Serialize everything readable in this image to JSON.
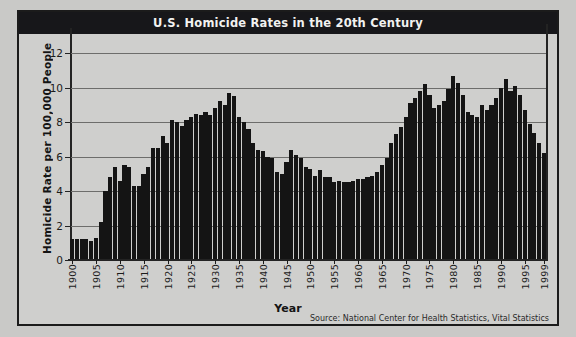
{
  "chart_data": {
    "type": "bar",
    "title": "U.S. Homicide Rates in the 20th Century",
    "xlabel": "Year",
    "ylabel": "Homicide Rate per 100,000 People",
    "source": "Source: National Center for Health Statistics, Vital Statistics",
    "ylim": [
      0,
      13
    ],
    "yticks": [
      0,
      2,
      4,
      6,
      8,
      10,
      12
    ],
    "ytick_labels": [
      "0",
      "2",
      "4",
      "6",
      "8",
      "10",
      "12"
    ],
    "grid": true,
    "grid_axis": "y",
    "legend": "none",
    "bar_color": "#141414",
    "title_bar_color": "#17171a",
    "title_text_color": "#f2f2f0",
    "panel_color": "#cfcfcd",
    "page_color": "#c9c9c7",
    "xtick_labels": [
      "1900",
      "1905",
      "1910",
      "1915",
      "1920",
      "1925",
      "1930",
      "1935",
      "1940",
      "1945",
      "1950",
      "1955",
      "1960",
      "1965",
      "1970",
      "1975",
      "1980",
      "1985",
      "1990",
      "1995",
      "1999"
    ],
    "xtick_years": [
      1900,
      1905,
      1910,
      1915,
      1920,
      1925,
      1930,
      1935,
      1940,
      1945,
      1950,
      1955,
      1960,
      1965,
      1970,
      1975,
      1980,
      1985,
      1990,
      1995,
      1999
    ],
    "x": [
      1900,
      1901,
      1902,
      1903,
      1904,
      1905,
      1906,
      1907,
      1908,
      1909,
      1910,
      1911,
      1912,
      1913,
      1914,
      1915,
      1916,
      1917,
      1918,
      1919,
      1920,
      1921,
      1922,
      1923,
      1924,
      1925,
      1926,
      1927,
      1928,
      1929,
      1930,
      1931,
      1932,
      1933,
      1934,
      1935,
      1936,
      1937,
      1938,
      1939,
      1940,
      1941,
      1942,
      1943,
      1944,
      1945,
      1946,
      1947,
      1948,
      1949,
      1950,
      1951,
      1952,
      1953,
      1954,
      1955,
      1956,
      1957,
      1958,
      1959,
      1960,
      1961,
      1962,
      1963,
      1964,
      1965,
      1966,
      1967,
      1968,
      1969,
      1970,
      1971,
      1972,
      1973,
      1974,
      1975,
      1976,
      1977,
      1978,
      1979,
      1980,
      1981,
      1982,
      1983,
      1984,
      1985,
      1986,
      1987,
      1988,
      1989,
      1990,
      1991,
      1992,
      1993,
      1994,
      1995,
      1996,
      1997,
      1998,
      1999
    ],
    "values": [
      1.2,
      1.2,
      1.2,
      1.2,
      1.1,
      1.3,
      2.2,
      4.0,
      4.8,
      5.4,
      4.6,
      5.5,
      5.4,
      4.3,
      4.3,
      5.0,
      5.4,
      6.5,
      6.5,
      7.2,
      6.8,
      8.1,
      8.0,
      7.8,
      8.1,
      8.3,
      8.5,
      8.4,
      8.6,
      8.4,
      8.8,
      9.2,
      9.0,
      9.7,
      9.5,
      8.3,
      8.0,
      7.6,
      6.8,
      6.4,
      6.3,
      6.0,
      5.9,
      5.1,
      5.0,
      5.7,
      6.4,
      6.1,
      5.9,
      5.4,
      5.3,
      4.9,
      5.2,
      4.8,
      4.8,
      4.5,
      4.6,
      4.5,
      4.5,
      4.6,
      4.7,
      4.7,
      4.8,
      4.9,
      5.1,
      5.5,
      5.9,
      6.8,
      7.3,
      7.7,
      8.3,
      9.1,
      9.4,
      9.8,
      10.2,
      9.6,
      8.8,
      9.0,
      9.2,
      9.9,
      10.7,
      10.3,
      9.6,
      8.6,
      8.4,
      8.3,
      9.0,
      8.7,
      9.0,
      9.4,
      10.0,
      10.5,
      9.8,
      10.1,
      9.6,
      8.7,
      7.9,
      7.4,
      6.8,
      6.2
    ]
  }
}
